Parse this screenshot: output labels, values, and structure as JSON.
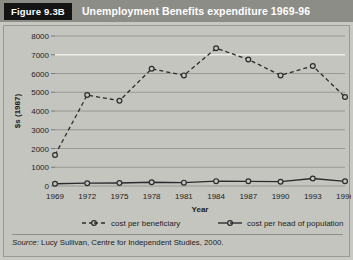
{
  "header": {
    "badge": "Figure 9.3B",
    "title": "Unemployment Benefits expenditure 1969-96",
    "badge_bg": "#141414",
    "band_bg": "#8d8d88",
    "text_color": "#ffffff"
  },
  "source": {
    "prefix": "Source:",
    "text": " Lucy Sullivan, Centre for Independent Studies, 2000."
  },
  "chart_data": {
    "type": "line",
    "title": "Unemployment Benefits expenditure 1969-96",
    "xlabel": "Year",
    "ylabel": "$s (1987)",
    "x": [
      1969,
      1972,
      1975,
      1978,
      1981,
      1984,
      1987,
      1990,
      1993,
      1996
    ],
    "categories": [
      "1969",
      "1972",
      "1975",
      "1978",
      "1981",
      "1984",
      "1987",
      "1990",
      "1993",
      "1996"
    ],
    "xlim": [
      1969,
      1996
    ],
    "ylim": [
      0,
      8000
    ],
    "yticks": [
      0,
      1000,
      2000,
      3000,
      4000,
      5000,
      6000,
      7000,
      8000
    ],
    "ytick_labels": [
      "0",
      "1000",
      "2000",
      "3000",
      "4000",
      "5000",
      "6000",
      "7000",
      "8000"
    ],
    "grid": true,
    "legend_position": "bottom",
    "series": [
      {
        "name": "cost per beneficiary",
        "style": "dashed",
        "marker": "circle",
        "color": "#2b2b2b",
        "values": [
          1650,
          4850,
          4550,
          6250,
          5900,
          7350,
          6750,
          5900,
          6400,
          4750
        ]
      },
      {
        "name": "cost per head of population",
        "style": "solid",
        "marker": "circle",
        "color": "#2b2b2b",
        "values": [
          120,
          150,
          160,
          200,
          180,
          260,
          250,
          230,
          400,
          250
        ]
      }
    ]
  }
}
